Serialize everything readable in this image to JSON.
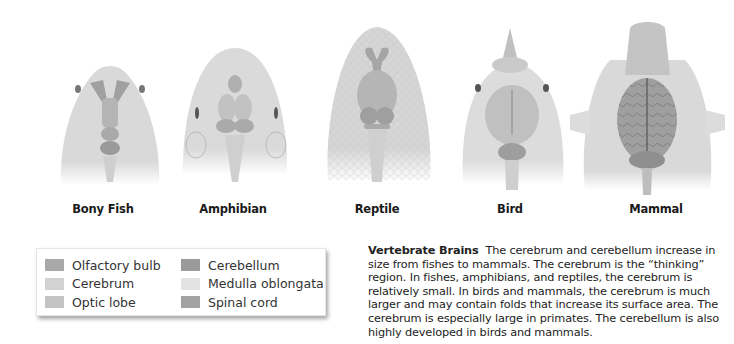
{
  "figures": [
    {
      "id": "bony-fish",
      "label": "Bony Fish"
    },
    {
      "id": "amphibian",
      "label": "Amphibian"
    },
    {
      "id": "reptile",
      "label": "Reptile"
    },
    {
      "id": "bird",
      "label": "Bird"
    },
    {
      "id": "mammal",
      "label": "Mammal"
    }
  ],
  "legend": {
    "items": [
      {
        "label": "Olfactory bulb",
        "color": "#a9a9a9"
      },
      {
        "label": "Cerebrum",
        "color": "#d2d2d2"
      },
      {
        "label": "Optic lobe",
        "color": "#c3c3c3"
      },
      {
        "label": "Cerebellum",
        "color": "#9a9a9a"
      },
      {
        "label": "Medulla oblongata",
        "color": "#e3e3e3"
      },
      {
        "label": "Spinal cord",
        "color": "#a2a2a2"
      }
    ]
  },
  "caption": {
    "title": "Vertebrate Brains",
    "text": "The cerebrum and cerebellum increase in size from fishes to mammals. The cerebrum is the “thinking” region. In fishes, amphibians, and reptiles, the cerebrum is relatively small. In birds and mammals, the cerebrum is much larger and may contain folds that increase its surface area. The cerebrum is especially large in primates. The cerebellum is also highly developed in birds and mammals."
  }
}
